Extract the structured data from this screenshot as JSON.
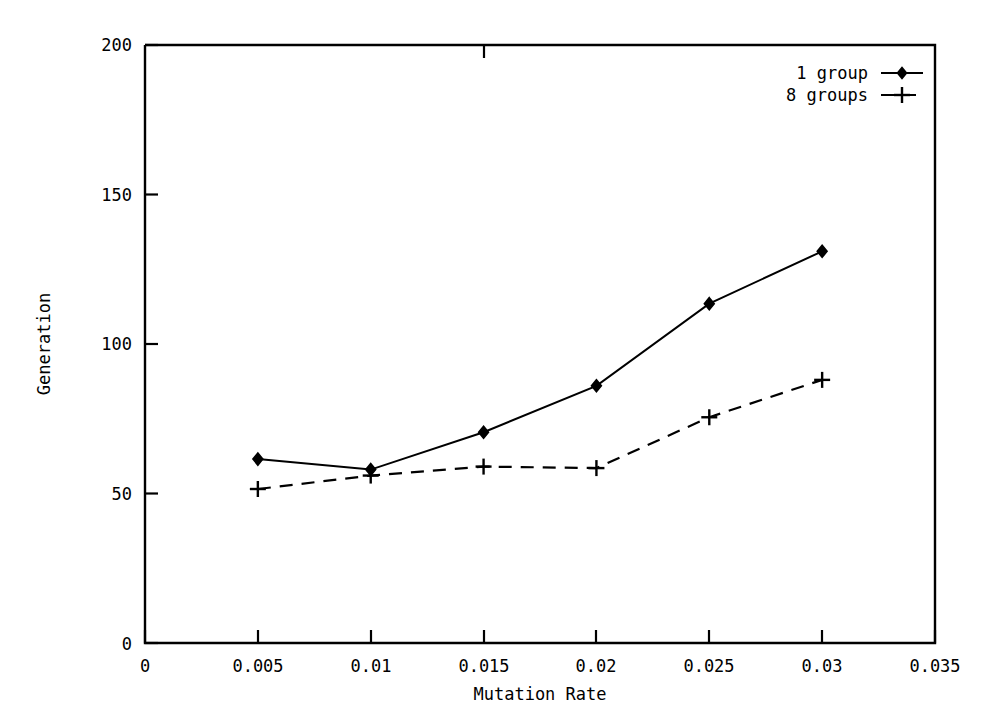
{
  "chart_data": {
    "type": "line",
    "title": "",
    "xlabel": "Mutation Rate",
    "ylabel": "Generation",
    "x": [
      0.005,
      0.01,
      0.015,
      0.02,
      0.025,
      0.03
    ],
    "xlim": [
      0,
      0.035
    ],
    "ylim": [
      0,
      200
    ],
    "xticks": [
      "0",
      "0.005",
      "0.01",
      "0.015",
      "0.02",
      "0.025",
      "0.03",
      "0.035"
    ],
    "xtick_values": [
      0,
      0.005,
      0.01,
      0.015,
      0.02,
      0.025,
      0.03,
      0.035
    ],
    "yticks": [
      "0",
      "50",
      "100",
      "150",
      "200"
    ],
    "ytick_values": [
      0,
      50,
      100,
      150,
      200
    ],
    "grid": false,
    "legend_position": "top-right",
    "series": [
      {
        "name": "1 group",
        "values": [
          61.5,
          58,
          70.5,
          86,
          113.5,
          131
        ],
        "line_style": "solid",
        "marker": "diamond",
        "color": "#000000"
      },
      {
        "name": "8 groups",
        "values": [
          51.5,
          56,
          59,
          58.5,
          75.5,
          88
        ],
        "line_style": "dashed",
        "marker": "plus",
        "color": "#000000"
      }
    ]
  },
  "axes": {
    "x_title": "Mutation Rate",
    "y_title": "Generation",
    "x_tick_labels": [
      "0",
      "0.005",
      "0.01",
      "0.015",
      "0.02",
      "0.025",
      "0.03",
      "0.035"
    ],
    "y_tick_labels": [
      "0",
      "50",
      "100",
      "150",
      "200"
    ]
  },
  "legend": {
    "entries": [
      {
        "label": "1 group",
        "marker": "diamond-marker",
        "style": "solid"
      },
      {
        "label": "8 groups",
        "marker": "plus-marker",
        "style": "dashed"
      }
    ]
  },
  "style": {
    "background": "#ffffff",
    "foreground": "#000000"
  }
}
